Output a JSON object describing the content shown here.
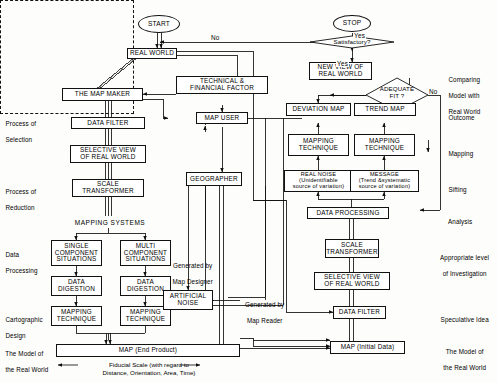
{
  "diagram": {
    "nodes": {
      "start": "START",
      "stop": "STOP",
      "real_world": "REAL WORLD",
      "map_maker": "THE MAP MAKER",
      "technical_financial": {
        "l1": "TECHNICAL &",
        "l2": "FINANCIAL FACTOR"
      },
      "map_user": "MAP USER",
      "data_filter_left": "DATA FILTER",
      "selective_view_left": {
        "l1": "SELECTIVE VIEW",
        "l2": "OF REAL WORLD"
      },
      "scale_transformer_left": {
        "l1": "SCALE",
        "l2": "TRANSFORMER"
      },
      "geographer": "GEOGRAPHER",
      "mapping_systems": "MAPPING  SYSTEMS",
      "single_component": {
        "l1": "SINGLE",
        "l2": "COMPONENT",
        "l3": "SITUATIONS"
      },
      "multi_component": {
        "l1": "MULTI",
        "l2": "COMPONENT",
        "l3": "SITUATIONS"
      },
      "data_digestion_1": {
        "l1": "DATA",
        "l2": "DIGESTION"
      },
      "data_digestion_2": {
        "l1": "DATA",
        "l2": "DIGESTION"
      },
      "mapping_technique_1": {
        "l1": "MAPPING",
        "l2": "TECHNIQUE"
      },
      "mapping_technique_2": {
        "l1": "MAPPING",
        "l2": "TECHNIQUE"
      },
      "artificial_noise": {
        "l1": "ARTIFICIAL",
        "l2": "NOISE"
      },
      "map_end_product": "MAP   (End Product)",
      "satisfactory": "Satisfactory?",
      "new_view": {
        "l1": "NEW VIEW OF",
        "l2": "REAL WORLD"
      },
      "adequate_fit": {
        "l1": "ADEQUATE",
        "l2": "FIT ?"
      },
      "deviation_map": "DEVIATION MAP",
      "trend_map": "TREND  MAP",
      "mapping_technique_3": {
        "l1": "MAPPING",
        "l2": "TECHNIQUE"
      },
      "mapping_technique_4": {
        "l1": "MAPPING",
        "l2": "TECHNIQUE"
      },
      "real_noise": {
        "l1": "REAL NOISE",
        "l2": "(Unidentifiable",
        "l3": "source of variation)"
      },
      "message": {
        "l1": "MESSAGE",
        "l2": "(Trend &systematic",
        "l3": "source of variation)"
      },
      "data_processing": "DATA PROCESSING",
      "scale_transformer_right": {
        "l1": "SCALE",
        "l2": "TRANSFORMER"
      },
      "selective_view_right": {
        "l1": "SELECTIVE VIEW",
        "l2": "OF REAL WORLD"
      },
      "data_filter_right": "DATA FILTER",
      "map_initial_data": "MAP  (Initial Data)"
    },
    "edge_labels": {
      "no_top": "No",
      "yes_stop": "Yes",
      "yes_adequate": "Yes",
      "no_adequate": "No",
      "generated_by_map_designer": {
        "l1": "Generated by",
        "l2": "Map Designer"
      },
      "generated_by_map_reader": {
        "l1": "Generated by",
        "l2": "Map Reader"
      }
    },
    "left_labels": [
      {
        "l1": "Process of",
        "l2": "Selection"
      },
      {
        "l1": "Process of",
        "l2": "Reduction"
      },
      {
        "l1": "Data",
        "l2": "Processing"
      },
      {
        "l1": "Cartographic",
        "l2": "Design"
      },
      {
        "l1": "The Model of",
        "l2": "the Real World"
      }
    ],
    "right_labels": [
      {
        "l1": "Comparing",
        "l2": "Model with",
        "l3": "Real World"
      },
      {
        "l1": "Outcome"
      },
      {
        "l1": "Mapping"
      },
      {
        "l1": "Sifting"
      },
      {
        "l1": "Analysis"
      },
      {
        "l1": "Appropriate level",
        "l2": "of Investigation"
      },
      {
        "l1": "Speculative Idea"
      },
      {
        "l1": "The Model of",
        "l2": "the Real World"
      }
    ],
    "footer": {
      "fiducial_l1": "Fiducial Scale (with regard to",
      "fiducial_l2": "Distance, Orientation, Area, Time)"
    },
    "colors": {
      "ink": "#111111",
      "paper": "#fdfdfb"
    }
  }
}
